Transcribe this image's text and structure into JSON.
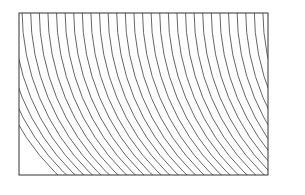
{
  "figure": {
    "frame": {
      "x": 19,
      "y": 13,
      "width": 249,
      "height": 162,
      "stroke": "#333333"
    },
    "lines": {
      "count": 30,
      "start_x": 22,
      "spacing": 8.6,
      "radius_offset": 229,
      "center_y": 10,
      "stroke": "#555555",
      "stroke_width": 0.9
    },
    "defect": {
      "x": 130,
      "y_start": 78,
      "y_end": 112
    }
  }
}
